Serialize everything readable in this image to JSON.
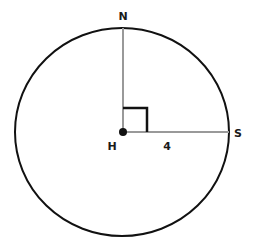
{
  "diagram": {
    "type": "circle-with-radii",
    "center": {
      "label": "H"
    },
    "points": [
      {
        "id": "N",
        "label": "N",
        "position": "top of circle"
      },
      {
        "id": "S",
        "label": "S",
        "position": "right of circle"
      }
    ],
    "segments": [
      {
        "from": "H",
        "to": "N",
        "label": ""
      },
      {
        "from": "H",
        "to": "S",
        "label": "4"
      }
    ],
    "angle_marker": {
      "at": "H",
      "type": "right-angle",
      "between": [
        "HN",
        "HS"
      ]
    },
    "colors": {
      "circle": "#111111",
      "radius": "#999999",
      "right_angle": "#111111",
      "center_dot": "#111111"
    }
  }
}
